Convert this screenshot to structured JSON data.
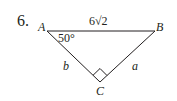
{
  "problem": {
    "number": "6."
  },
  "triangle": {
    "vertices": {
      "A": "A",
      "B": "B",
      "C": "C"
    },
    "sides": {
      "AB": "6√2",
      "AC": "b",
      "BC": "a"
    },
    "angles": {
      "A": "50°",
      "C_right_angle": true
    },
    "colors": {
      "stroke": "#231f20",
      "background": "#ffffff"
    }
  }
}
